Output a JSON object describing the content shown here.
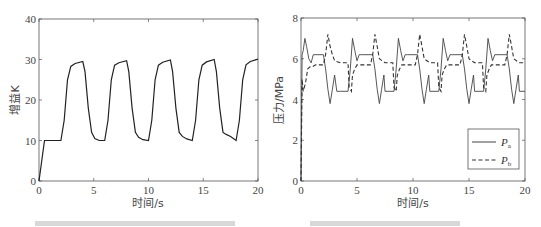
{
  "chart_data": [
    {
      "type": "line",
      "title": "",
      "xlabel": "时间/s",
      "ylabel": "增益K",
      "xlim": [
        0,
        20
      ],
      "ylim": [
        0,
        40
      ],
      "xticks": [
        0,
        5,
        10,
        15,
        20
      ],
      "yticks": [
        0,
        10,
        20,
        30,
        40
      ],
      "grid": false,
      "legend": null,
      "series": [
        {
          "name": "K",
          "style": "solid",
          "x": [
            0,
            0.5,
            2.0,
            2.3,
            2.6,
            2.9,
            3.3,
            4.0,
            4.2,
            4.5,
            4.8,
            5.1,
            5.5,
            6.0,
            6.3,
            6.6,
            6.9,
            7.3,
            8.0,
            8.2,
            8.5,
            8.8,
            9.1,
            9.5,
            10.0,
            10.3,
            10.6,
            10.9,
            11.3,
            12.0,
            12.2,
            12.5,
            12.8,
            13.1,
            13.5,
            14.0,
            14.3,
            14.6,
            14.9,
            15.3,
            16.0,
            16.2,
            16.5,
            16.8,
            17.1,
            17.5,
            18.0,
            18.3,
            18.6,
            18.9,
            19.3,
            20.0
          ],
          "y": [
            0,
            10,
            10,
            15,
            25,
            28.3,
            29.0,
            29.5,
            27,
            18,
            12,
            10.5,
            10,
            10,
            15,
            25,
            28.6,
            29.2,
            29.7,
            27,
            18,
            12,
            10.8,
            10.2,
            10,
            15,
            25,
            28.6,
            29.3,
            29.9,
            27,
            18,
            12,
            11,
            10.4,
            10,
            15,
            25,
            28.6,
            29.4,
            30.0,
            27,
            18,
            12,
            11.5,
            11,
            10,
            15,
            25,
            28.7,
            29.5,
            30.1
          ]
        }
      ]
    },
    {
      "type": "line",
      "title": "",
      "xlabel": "时间/s",
      "ylabel": "压力/MPa",
      "xlim": [
        0,
        20
      ],
      "ylim": [
        0,
        8
      ],
      "xticks": [
        0,
        5,
        10,
        15,
        20
      ],
      "yticks": [
        0,
        2,
        4,
        6,
        8
      ],
      "grid": false,
      "legend": {
        "position": "lower right",
        "entries": [
          {
            "label": "P",
            "sub": "a",
            "style": "solid"
          },
          {
            "label": "P",
            "sub": "b",
            "style": "dashed"
          }
        ]
      },
      "series": [
        {
          "name": "Pa",
          "style": "solid",
          "x": [
            0,
            0.1,
            0.2,
            0.35,
            0.5,
            0.7,
            0.9,
            1.1,
            2.0,
            2.2,
            2.4,
            2.6,
            2.8,
            3.0,
            3.2,
            3.5,
            4.2,
            4.4,
            4.6,
            4.8,
            5.0,
            5.2,
            5.4,
            6.4,
            6.6,
            6.8,
            7.0,
            7.2,
            7.4,
            7.5,
            8.3,
            8.5,
            8.7,
            8.9,
            9.1,
            9.3,
            9.5,
            10.4,
            10.6,
            10.8,
            11.0,
            11.2,
            11.4,
            11.5,
            12.3,
            12.5,
            12.7,
            12.9,
            13.1,
            13.3,
            13.5,
            14.4,
            14.6,
            14.8,
            15.0,
            15.2,
            15.4,
            15.5,
            16.3,
            16.5,
            16.7,
            16.9,
            17.1,
            17.3,
            17.5,
            18.4,
            18.6,
            18.8,
            19.0,
            19.2,
            19.4,
            19.5,
            20.0
          ],
          "y": [
            0,
            6.2,
            6.4,
            7.0,
            6.6,
            6.0,
            5.8,
            6.2,
            6.2,
            5.5,
            4.5,
            3.8,
            4.5,
            5.2,
            4.4,
            4.4,
            4.4,
            5.5,
            7.0,
            6.4,
            5.9,
            6.2,
            6.2,
            6.2,
            5.5,
            4.5,
            3.8,
            4.5,
            5.2,
            4.4,
            4.4,
            5.5,
            7.0,
            6.4,
            5.9,
            6.2,
            6.2,
            6.2,
            5.5,
            4.5,
            3.8,
            4.5,
            5.2,
            4.4,
            4.4,
            5.5,
            7.0,
            6.4,
            5.9,
            6.2,
            6.2,
            6.2,
            5.5,
            4.5,
            3.8,
            4.5,
            5.2,
            4.4,
            4.4,
            5.5,
            7.0,
            6.4,
            5.9,
            6.2,
            6.2,
            6.2,
            5.5,
            4.5,
            3.8,
            4.5,
            5.2,
            4.4,
            4.4
          ]
        },
        {
          "name": "Pb",
          "style": "dashed",
          "x": [
            0,
            0.1,
            0.2,
            0.4,
            0.6,
            0.8,
            1.0,
            1.3,
            2.0,
            2.2,
            2.4,
            2.6,
            2.8,
            3.0,
            3.5,
            4.2,
            4.3,
            4.5,
            4.6,
            4.8,
            5.0,
            5.4,
            6.2,
            6.4,
            6.6,
            6.8,
            7.0,
            7.5,
            8.2,
            8.3,
            8.5,
            8.6,
            8.8,
            9.0,
            9.4,
            10.2,
            10.4,
            10.6,
            10.8,
            11.0,
            11.5,
            12.2,
            12.3,
            12.5,
            12.6,
            12.8,
            13.0,
            13.4,
            14.2,
            14.4,
            14.6,
            14.8,
            15.0,
            15.5,
            16.2,
            16.3,
            16.5,
            16.6,
            16.8,
            17.0,
            17.4,
            18.2,
            18.4,
            18.6,
            18.8,
            19.0,
            19.5,
            20.0
          ],
          "y": [
            0,
            5.0,
            4.4,
            4.8,
            5.5,
            5.6,
            5.6,
            5.7,
            5.7,
            6.2,
            7.2,
            6.6,
            6.2,
            5.9,
            5.8,
            5.8,
            4.6,
            4.4,
            5.2,
            5.5,
            5.7,
            5.7,
            5.7,
            6.2,
            7.2,
            6.6,
            6.0,
            5.8,
            5.8,
            4.6,
            4.4,
            5.2,
            5.5,
            5.7,
            5.7,
            5.7,
            6.2,
            7.2,
            6.6,
            6.0,
            5.8,
            5.8,
            4.6,
            4.4,
            5.2,
            5.5,
            5.7,
            5.7,
            5.7,
            6.2,
            7.2,
            6.6,
            6.0,
            5.8,
            5.8,
            4.6,
            4.4,
            5.2,
            5.5,
            5.7,
            5.7,
            5.7,
            6.2,
            7.2,
            6.6,
            6.0,
            5.8,
            5.8
          ]
        }
      ]
    }
  ],
  "plots": [
    {
      "xlabel": "时间/s",
      "ylabel": "增益K"
    },
    {
      "xlabel": "时间/s",
      "ylabel": "压力/MPa",
      "legend": {
        "a_label": "P",
        "a_sub": "a",
        "b_label": "P",
        "b_sub": "b"
      }
    }
  ]
}
